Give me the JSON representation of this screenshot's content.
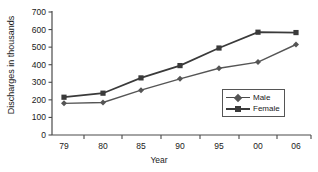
{
  "chart_data": {
    "type": "line",
    "title": "",
    "xlabel": "Year",
    "ylabel": "Discharges in thousands",
    "categories": [
      "79",
      "80",
      "85",
      "90",
      "95",
      "00",
      "06"
    ],
    "series": [
      {
        "name": "Male",
        "values": [
          180,
          185,
          255,
          320,
          380,
          415,
          515
        ],
        "color": "#555555",
        "marker": "diamond"
      },
      {
        "name": "Female",
        "values": [
          215,
          238,
          325,
          395,
          495,
          585,
          583
        ],
        "color": "#3a3a3a",
        "marker": "square"
      }
    ],
    "ylim": [
      0,
      700
    ],
    "yticks": [
      0,
      100,
      200,
      300,
      400,
      500,
      600,
      700
    ],
    "ytick_labels": [
      "0",
      "100",
      "200",
      "300",
      "400",
      "500",
      "600",
      "700"
    ],
    "grid": false,
    "legend_position": "inside-bottom-right"
  },
  "legend": {
    "items": [
      {
        "label": "Male"
      },
      {
        "label": "Female"
      }
    ]
  },
  "axes": {
    "x_title": "Year",
    "y_title": "Discharges in thousands"
  }
}
